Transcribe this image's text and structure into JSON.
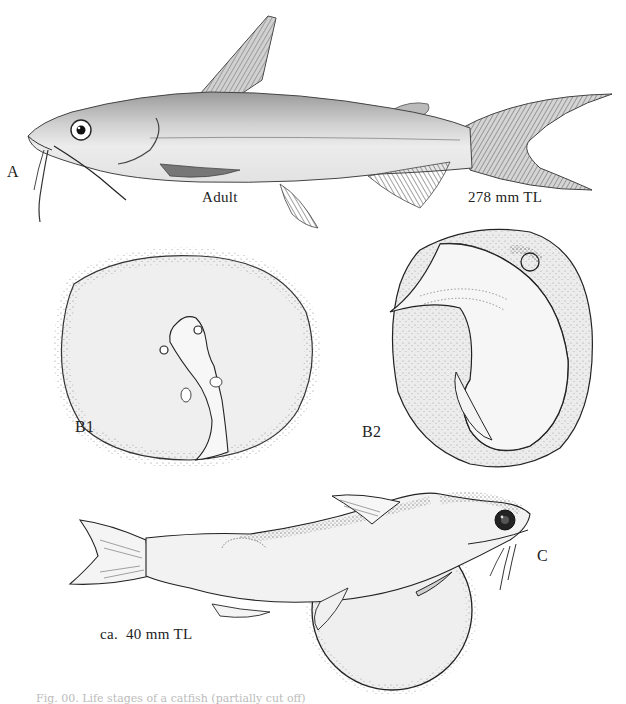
{
  "figure": {
    "panels": {
      "A": {
        "letter": "A",
        "stage": "Adult",
        "size": "278 mm TL"
      },
      "B1": {
        "letter": "B1"
      },
      "B2": {
        "letter": "B2"
      },
      "C": {
        "letter": "C",
        "size": "ca.  40 mm TL"
      }
    },
    "caption": "Fig. 00.  Life stages of a catfish (partially cut off)"
  },
  "colors": {
    "ink": "#1a1a1a",
    "body_fill": "#e4e4e4",
    "egg_fill": "#ececec",
    "background": "#ffffff"
  }
}
